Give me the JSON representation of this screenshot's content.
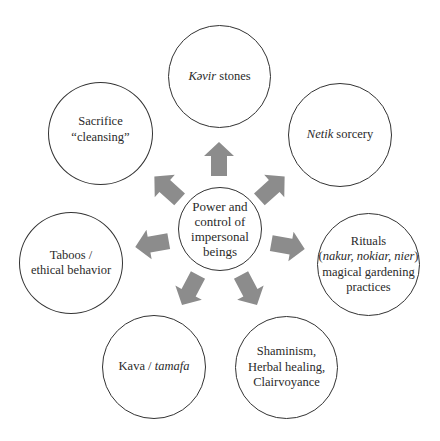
{
  "diagram": {
    "center": {
      "lines": [
        "Power and",
        "control of",
        "impersonal",
        "beings"
      ]
    },
    "nodes": [
      {
        "id": "kavir-stones",
        "italic": "Kəvir",
        "rest": " stones"
      },
      {
        "id": "netik-sorcery",
        "italic": "Netik",
        "rest": " sorcery"
      },
      {
        "id": "rituals",
        "line1": "Rituals",
        "line2_open": "(",
        "line2_italic": "nakur, nokiar, nier",
        "line2_close": ")",
        "line3": "magical gardening",
        "line4": "practices"
      },
      {
        "id": "shaminism",
        "line1": "Shaminism,",
        "line2": "Herbal healing,",
        "line3": "Clairvoyance"
      },
      {
        "id": "kava",
        "plain": "Kava / ",
        "italic": "tamafa"
      },
      {
        "id": "taboos",
        "line1": "Taboos /",
        "line2": "ethical behavior"
      },
      {
        "id": "sacrifice",
        "line1": "Sacrifice",
        "line2": "“cleansing”"
      }
    ],
    "arrows": [
      {
        "direction": "up",
        "target": "kavir-stones"
      },
      {
        "direction": "up-right",
        "target": "netik-sorcery"
      },
      {
        "direction": "right",
        "target": "rituals"
      },
      {
        "direction": "down-right",
        "target": "shaminism"
      },
      {
        "direction": "down-left",
        "target": "kava"
      },
      {
        "direction": "left",
        "target": "taboos"
      },
      {
        "direction": "up-left",
        "target": "sacrifice"
      }
    ],
    "colors": {
      "arrow_fill": "#8c8c8c",
      "circle_stroke": "#333333",
      "text": "#2a2a2a"
    }
  }
}
